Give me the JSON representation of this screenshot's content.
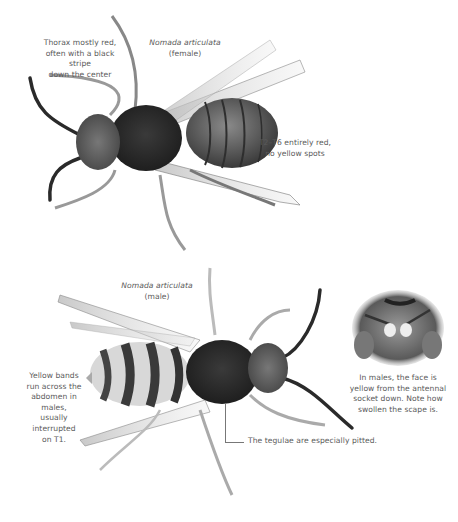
{
  "page": {
    "background": "#ffffff",
    "text_color": "#5a5a5a"
  },
  "female": {
    "species": "Nomada articulata",
    "sex": "(female)",
    "caption_thorax": [
      "Thorax mostly red,",
      "often with a black stripe",
      "down the center"
    ],
    "caption_abdomen": [
      "T2–T6 entirely red,",
      "no yellow spots"
    ]
  },
  "male": {
    "species": "Nomada articulata",
    "sex": "(male)",
    "caption_abdomen": [
      "Yellow bands",
      "run across the",
      "abdomen in males,",
      "usually interrupted",
      "on T1."
    ],
    "caption_tegulae": "The tegulae are especially pitted.",
    "caption_face": [
      "In males, the face is",
      "yellow from the antennal",
      "socket down. Note how",
      "swollen the scape is."
    ]
  },
  "icons": {
    "female_bee": "bee-specimen-female-photo",
    "male_bee": "bee-specimen-male-photo",
    "face_inset": "bee-face-closeup-photo"
  }
}
